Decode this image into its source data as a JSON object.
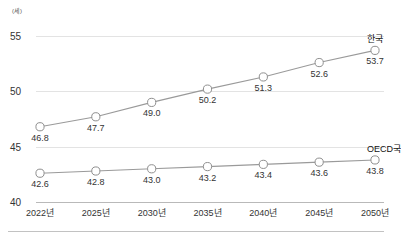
{
  "chart_data": {
    "type": "line",
    "title": "",
    "subtitle": "",
    "unit_label": "(세)",
    "xlabel": "",
    "ylabel": "",
    "categories": [
      "2022년",
      "2025년",
      "2030년",
      "2035년",
      "2040년",
      "2045년",
      "2050년"
    ],
    "ylim": [
      40,
      55
    ],
    "yticks": [
      40,
      45,
      50,
      55
    ],
    "grid": true,
    "legend_position": "series-end-right",
    "series": [
      {
        "name": "한국",
        "values": [
          46.8,
          47.7,
          49.0,
          50.2,
          51.3,
          52.6,
          53.7
        ],
        "value_labels": [
          "46.8",
          "47.7",
          "49.0",
          "50.2",
          "51.3",
          "52.6",
          "53.7"
        ],
        "color": "#9a9a9a",
        "marker": "open-circle"
      },
      {
        "name": "OECD국",
        "values": [
          42.6,
          42.8,
          43.0,
          43.2,
          43.4,
          43.6,
          43.8
        ],
        "value_labels": [
          "42.6",
          "42.8",
          "43.0",
          "43.2",
          "43.4",
          "43.6",
          "43.8"
        ],
        "color": "#9a9a9a",
        "marker": "open-circle"
      }
    ],
    "colors": {
      "line": "#9a9a9a",
      "marker_fill": "#ffffff",
      "marker_stroke": "#8f8f8f",
      "gridline": "#e3e3e3",
      "baseline": "#b9b9b9",
      "text": "#333333"
    }
  }
}
